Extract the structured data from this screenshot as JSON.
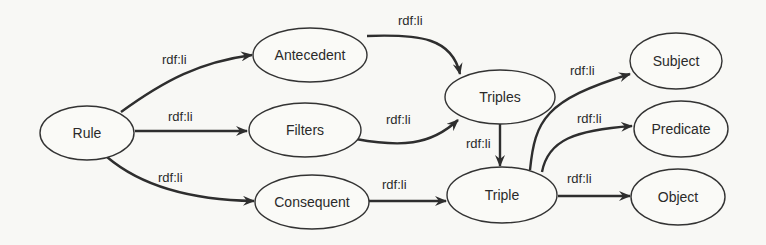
{
  "diagram": {
    "type": "graph",
    "nodes": [
      {
        "id": "rule",
        "label": "Rule"
      },
      {
        "id": "antecedent",
        "label": "Antecedent"
      },
      {
        "id": "filters",
        "label": "Filters"
      },
      {
        "id": "consequent",
        "label": "Consequent"
      },
      {
        "id": "triples",
        "label": "Triples"
      },
      {
        "id": "triple",
        "label": "Triple"
      },
      {
        "id": "subject",
        "label": "Subject"
      },
      {
        "id": "predicate",
        "label": "Predicate"
      },
      {
        "id": "object",
        "label": "Object"
      }
    ],
    "edges": [
      {
        "from": "rule",
        "to": "antecedent",
        "label": "rdf:li"
      },
      {
        "from": "rule",
        "to": "filters",
        "label": "rdf:li"
      },
      {
        "from": "rule",
        "to": "consequent",
        "label": "rdf:li"
      },
      {
        "from": "antecedent",
        "to": "triples",
        "label": "rdf:li"
      },
      {
        "from": "filters",
        "to": "triples",
        "label": "rdf:li"
      },
      {
        "from": "triples",
        "to": "triple",
        "label": "rdf:li"
      },
      {
        "from": "consequent",
        "to": "triple",
        "label": "rdf:li"
      },
      {
        "from": "triple",
        "to": "subject",
        "label": "rdf:li"
      },
      {
        "from": "triple",
        "to": "predicate",
        "label": "rdf:li"
      },
      {
        "from": "triple",
        "to": "object",
        "label": "rdf:li"
      }
    ]
  }
}
